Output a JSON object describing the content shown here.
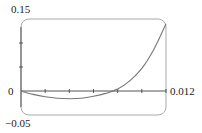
{
  "chart_data": {
    "type": "line",
    "title": "",
    "xlabel": "",
    "ylabel": "",
    "xlim": [
      0,
      0.012
    ],
    "ylim": [
      -0.05,
      0.15
    ],
    "grid": false,
    "legend": null,
    "x_tick_labels": [
      "0.012"
    ],
    "y_tick_labels": [
      "0.15",
      "0",
      "-0.05"
    ],
    "x_ticks": [
      0,
      0.002,
      0.004,
      0.006,
      0.008,
      0.01,
      0.012
    ],
    "y_ticks": [
      -0.05,
      0,
      0.05,
      0.1,
      0.15
    ],
    "series": [
      {
        "name": "curve",
        "x": [
          0,
          0.001,
          0.002,
          0.003,
          0.004,
          0.005,
          0.006,
          0.007,
          0.008,
          0.009,
          0.01,
          0.011,
          0.012
        ],
        "y": [
          0,
          -0.007,
          -0.012,
          -0.015,
          -0.016,
          -0.015,
          -0.011,
          -0.005,
          0.004,
          0.021,
          0.047,
          0.087,
          0.14
        ]
      }
    ]
  },
  "labels": {
    "y_top": "0.15",
    "y_zero": "0",
    "y_bottom": "−0.05",
    "x_right": "0.012"
  },
  "colors": {
    "frame": "#aaaaaa",
    "axis": "#555555",
    "curve": "#777777"
  }
}
